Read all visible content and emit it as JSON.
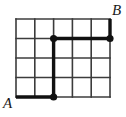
{
  "figure": {
    "type": "grid-path-diagram",
    "background_color": "#ffffff"
  },
  "grid": {
    "columns": 5,
    "rows": 4,
    "origin_x": 16,
    "origin_y": 19,
    "cell_width": 18.8,
    "cell_height": 19.5,
    "line_color": "#3c3c3c",
    "line_width": 1.6,
    "x_positions": [
      16,
      34.8,
      53.6,
      72.4,
      91.2,
      110
    ],
    "y_positions": [
      19,
      38.5,
      58,
      77.5,
      97
    ]
  },
  "path": {
    "stroke_color": "#111111",
    "stroke_width": 3.4,
    "description": "bold lattice path from A to B",
    "segments": [
      {
        "name": "bottom-horizontal",
        "x1": 16,
        "y1": 97,
        "x2": 53.6,
        "y2": 97
      },
      {
        "name": "middle-vertical",
        "x1": 53.6,
        "y1": 97,
        "x2": 53.6,
        "y2": 38.5
      },
      {
        "name": "upper-horizontal",
        "x1": 53.6,
        "y1": 38.5,
        "x2": 110,
        "y2": 38.5
      },
      {
        "name": "right-vertical",
        "x1": 110,
        "y1": 38.5,
        "x2": 110,
        "y2": 19
      }
    ]
  },
  "nodes": {
    "radius": 3.6,
    "color": "#111111",
    "points": [
      {
        "name": "node-bottom-turn",
        "x": 53.6,
        "y": 97
      },
      {
        "name": "node-middle-turn",
        "x": 53.6,
        "y": 38.5
      },
      {
        "name": "node-right-turn",
        "x": 110,
        "y": 38.5
      }
    ]
  },
  "labels": {
    "start": "A",
    "end": "B"
  }
}
